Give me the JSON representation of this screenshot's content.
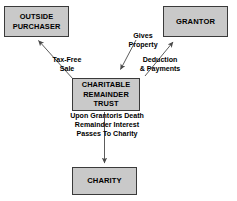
{
  "diagram": {
    "colors": {
      "node_fill": "#c9c9c9",
      "node_border": "#3a3a3a",
      "text": "#000000",
      "background": "#ffffff",
      "arrow": "#4a4a4a"
    },
    "nodes": {
      "outside_purchaser": "OUTSIDE\nPURCHASER",
      "grantor": "GRANTOR",
      "charitable_remainder_trust": "CHARITABLE\nREMAINDER\nTRUST",
      "charity": "CHARITY"
    },
    "edge_labels": {
      "tax_free_sale": "Tax-Free\nSale",
      "gives_property": "Gives\nProperty",
      "deduction_and_payments": "Deduction\n& Payments",
      "remainder_passes": "Upon Grantoris Death\nRemainder Interest\nPasses To Charity"
    },
    "edges": [
      {
        "from": "charitable_remainder_trust",
        "to": "outside_purchaser",
        "label": "Tax-Free Sale",
        "direction": "up-left"
      },
      {
        "from": "grantor",
        "to": "charitable_remainder_trust",
        "label": "Gives Property",
        "direction": "down-left"
      },
      {
        "from": "charitable_remainder_trust",
        "to": "grantor",
        "label": "Deduction & Payments",
        "direction": "up-right"
      },
      {
        "from": "charitable_remainder_trust",
        "to": "charity",
        "label": "Upon Grantoris Death Remainder Interest Passes To Charity",
        "direction": "down"
      }
    ]
  }
}
